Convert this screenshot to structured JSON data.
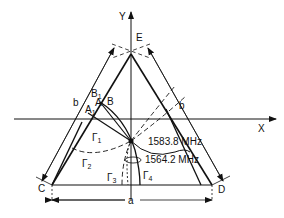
{
  "diagram": {
    "axes": {
      "x_label": "X",
      "y_label": "Y"
    },
    "vertices": {
      "top": "E",
      "bottom_left": "C",
      "bottom_right": "D"
    },
    "points": {
      "A": "A",
      "A1": "A",
      "A1_sub": "1",
      "B": "B",
      "B1": "B",
      "B1_sub": "1"
    },
    "dimensions": {
      "left_side": "b",
      "right_side": "b",
      "base": "a"
    },
    "regions": [
      {
        "label": "Γ",
        "sub": "1"
      },
      {
        "label": "Γ",
        "sub": "2"
      },
      {
        "label": "Γ",
        "sub": "3"
      },
      {
        "label": "Γ",
        "sub": "4"
      }
    ],
    "frequencies": [
      {
        "value": "1583.8 MHz"
      },
      {
        "value": "1564.2 MHz"
      }
    ],
    "colors": {
      "line": "#111111",
      "background": "#ffffff"
    }
  }
}
